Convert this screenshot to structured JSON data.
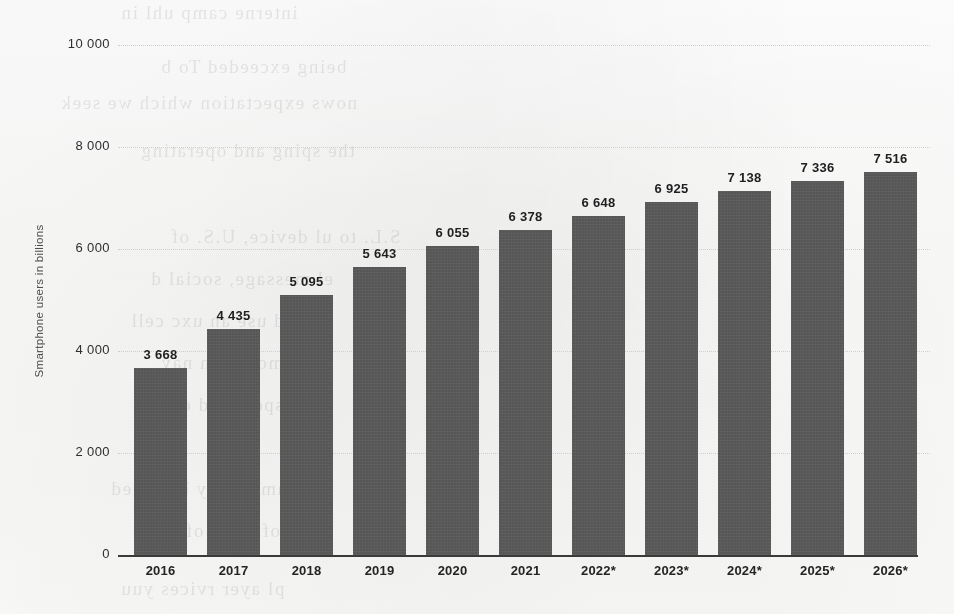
{
  "chart_data": {
    "type": "bar",
    "title": "",
    "subtitle": "",
    "xlabel": "",
    "ylabel": "Smartphone users in billions",
    "categories": [
      "2016",
      "2017",
      "2018",
      "2019",
      "2020",
      "2021",
      "2022*",
      "2023*",
      "2024*",
      "2025*",
      "2026*"
    ],
    "values": [
      3668,
      4435,
      5095,
      5643,
      6055,
      6378,
      6648,
      6925,
      7138,
      7336,
      7516
    ],
    "value_labels": [
      "3 668",
      "4 435",
      "5 095",
      "5 643",
      "6 055",
      "6 378",
      "6 648",
      "6 925",
      "7 138",
      "7 336",
      "7 516"
    ],
    "ylim": [
      0,
      10000
    ],
    "ytick_values": [
      0,
      2000,
      4000,
      6000,
      8000,
      10000
    ],
    "ytick_labels": [
      "0",
      "2 000",
      "4 000",
      "6 000",
      "8 000",
      "10 000"
    ],
    "grid": true,
    "grid_axis": "y",
    "legend": false,
    "legend_position": "none",
    "bar_color": "#5a5a5a",
    "thousands_separator": " ",
    "forecast_marker": "*",
    "forecast_categories": [
      "2022*",
      "2023*",
      "2024*",
      "2025*",
      "2026*"
    ]
  },
  "background": {
    "ghost_text": [
      "interne camp uhl in",
      "being exceeded To b",
      "nows expectation which we seek",
      "the sping and operating",
      "S.L. to ul device,  U.S. of",
      "el  message, social d",
      "ns and use  an uxc cell",
      "de  mountain    nay",
      "ou   aspect and oss  w",
      "e camp  verly brand ed",
      "ent of  tuuls of lhe",
      "pl ayer  rvices   yuu"
    ]
  }
}
